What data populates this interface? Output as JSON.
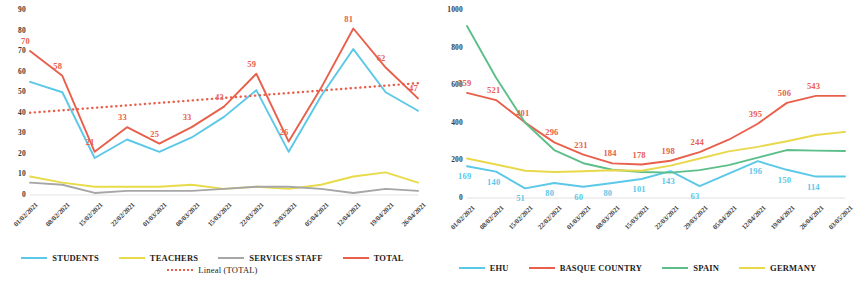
{
  "charts": [
    {
      "id": "left",
      "title": "",
      "chart_data": {
        "type": "line",
        "title": "",
        "xlabel": "",
        "ylabel": "",
        "ylim": [
          0,
          90
        ],
        "yticks": [
          0,
          10,
          20,
          30,
          40,
          50,
          60,
          70,
          80,
          90
        ],
        "grid": false,
        "legend_position": "bottom",
        "categories": [
          "01/02/2021",
          "08/02/2021",
          "15/02/2021",
          "22/02/2021",
          "01/03/2021",
          "08/03/2021",
          "15/03/2021",
          "22/03/2021",
          "29/03/2021",
          "05/04/2021",
          "12/04/2021",
          "19/04/2021",
          "26/04/2021"
        ],
        "series": [
          {
            "name": "STUDENTS",
            "color": "#5BC8E8",
            "style": "solid",
            "values": [
              55,
              50,
              18,
              27,
              21,
              28,
              38,
              51,
              21,
              48,
              71,
              50,
              41
            ],
            "labels": []
          },
          {
            "name": "TEACHERS",
            "color": "#E8DB4A",
            "style": "solid",
            "values": [
              9,
              6,
              4,
              4,
              4,
              5,
              3,
              4,
              3,
              5,
              9,
              11,
              6
            ],
            "labels": []
          },
          {
            "name": "SERVICES STAFF",
            "color": "#A6A6A6",
            "style": "solid",
            "values": [
              6,
              5,
              1,
              2,
              2,
              2,
              3,
              4,
              4,
              3,
              1,
              3,
              2
            ],
            "labels": []
          },
          {
            "name": "TOTAL",
            "color": "#E8604C",
            "style": "solid",
            "values": [
              70,
              58,
              21,
              33,
              25,
              33,
              43,
              59,
              26,
              52,
              81,
              62,
              47
            ],
            "labels": [
              "70",
              "58",
              "21",
              "33",
              "25",
              "33",
              "43",
              "59",
              "26",
              "",
              "81",
              "62",
              "47"
            ]
          },
          {
            "name": "Lineal (TOTAL)",
            "color": "#E8604C",
            "style": "dotted",
            "values": [
              40.0,
              41.2,
              42.4,
              43.6,
              44.8,
              46.0,
              47.2,
              48.4,
              49.6,
              50.8,
              52.0,
              53.2,
              54.4
            ],
            "labels": []
          }
        ]
      },
      "legend": [
        {
          "label": "STUDENTS",
          "color": "#5BC8E8",
          "style": "solid"
        },
        {
          "label": "TEACHERS",
          "color": "#E8DB4A",
          "style": "solid"
        },
        {
          "label": "SERVICES STAFF",
          "color": "#A6A6A6",
          "style": "solid"
        },
        {
          "label": "TOTAL",
          "color": "#E8604C",
          "style": "solid"
        },
        {
          "label": "Lineal (TOTAL)",
          "color": "#E8604C",
          "style": "dotted"
        }
      ]
    },
    {
      "id": "right",
      "title": "",
      "chart_data": {
        "type": "line",
        "title": "",
        "xlabel": "",
        "ylabel": "",
        "ylim": [
          0,
          1000
        ],
        "yticks": [
          0,
          200,
          400,
          600,
          800,
          1000
        ],
        "grid": false,
        "legend_position": "bottom",
        "categories": [
          "01/02/2021",
          "08/02/2021",
          "15/02/2021",
          "22/02/2021",
          "01/03/2021",
          "08/03/2021",
          "15/03/2021",
          "22/03/2021",
          "29/03/2021",
          "05/04/2021",
          "12/04/2021",
          "19/04/2021",
          "26/04/2021",
          "03/05/2021"
        ],
        "series": [
          {
            "name": "EHU",
            "color": "#5BC8E8",
            "style": "solid",
            "values": [
              169,
              140,
              51,
              80,
              60,
              80,
              101,
              143,
              63,
              130,
              196,
              150,
              114,
              114
            ],
            "labels": [
              "169",
              "140",
              "51",
              "80",
              "60",
              "80",
              "101",
              "143",
              "63",
              "",
              "196",
              "150",
              "114",
              ""
            ]
          },
          {
            "name": "BASQUE COUNTRY",
            "color": "#E8604C",
            "style": "solid",
            "values": [
              559,
              521,
              401,
              296,
              231,
              184,
              178,
              198,
              244,
              310,
              395,
              506,
              543,
              543
            ],
            "labels": [
              "559",
              "521",
              "401",
              "296",
              "231",
              "184",
              "178",
              "198",
              "244",
              "",
              "395",
              "506",
              "543",
              ""
            ]
          },
          {
            "name": "SPAIN",
            "color": "#5CBF8A",
            "style": "solid",
            "values": [
              915,
              640,
              400,
              255,
              185,
              150,
              138,
              135,
              148,
              175,
              215,
              255,
              252,
              250
            ],
            "labels": []
          },
          {
            "name": "GERMANY",
            "color": "#E8D84A",
            "style": "solid",
            "values": [
              210,
              178,
              145,
              138,
              142,
              148,
              145,
              172,
              210,
              248,
              272,
              302,
              335,
              352
            ],
            "labels": []
          }
        ]
      },
      "legend": [
        {
          "label": "EHU",
          "color": "#5BC8E8",
          "style": "solid"
        },
        {
          "label": "BASQUE COUNTRY",
          "color": "#E8604C",
          "style": "solid"
        },
        {
          "label": "SPAIN",
          "color": "#5CBF8A",
          "style": "solid"
        },
        {
          "label": "GERMANY",
          "color": "#E8D84A",
          "style": "solid"
        }
      ]
    }
  ]
}
